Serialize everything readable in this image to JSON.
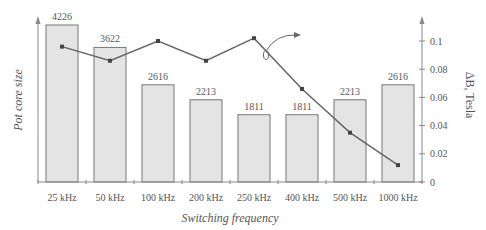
{
  "chart_data": {
    "type": "bar",
    "title": "",
    "xlabel": "Switching frequency",
    "ylabel": "Pot core size",
    "y2label": "ΔB, Tesla",
    "categories": [
      "25 kHz",
      "50 kHz",
      "100 kHz",
      "200 kHz",
      "250 kHz",
      "400 kHz",
      "500 kHz",
      "1000 kHz"
    ],
    "series": [
      {
        "name": "Pot core size",
        "type": "bar",
        "axis": "left",
        "values": [
          4226,
          3622,
          2616,
          2213,
          1811,
          1811,
          2213,
          2616
        ]
      },
      {
        "name": "ΔB, Tesla",
        "type": "line",
        "axis": "right",
        "values": [
          0.096,
          0.086,
          0.1,
          0.086,
          0.102,
          0.066,
          0.035,
          0.012
        ]
      }
    ],
    "y2ticks": [
      "0",
      "0.02",
      "0.04",
      "0.06",
      "0.08",
      "0.1"
    ],
    "y2lim": [
      0,
      0.11
    ],
    "grid": false,
    "annotations": [
      "curved arrow pointing from line near 250 kHz toward right axis"
    ]
  },
  "colors": {
    "bar_fill": "#e4e4e4",
    "bar_stroke": "#777777",
    "line": "#666666",
    "axis": "#888888",
    "text": "#555555"
  }
}
